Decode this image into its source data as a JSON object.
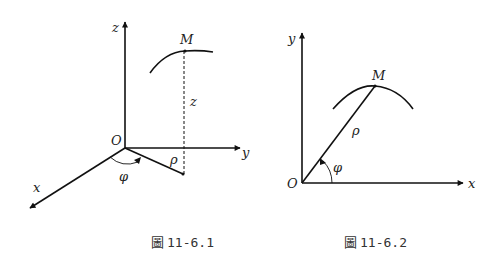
{
  "figures": [
    {
      "id": "fig-1",
      "caption_mark": "圖",
      "caption_number": "11-6.1",
      "labels": {
        "origin": "O",
        "x_axis": "x",
        "y_axis": "y",
        "z_axis": "z",
        "point": "M",
        "height": "z",
        "radius": "ρ",
        "angle": "φ"
      },
      "description": "Cylindrical coordinates in 3D: point M on a curve, dashed vertical segment of length z to the xy-plane, radial segment ρ from O at angle φ from the x-axis"
    },
    {
      "id": "fig-2",
      "caption_mark": "圖",
      "caption_number": "11-6.2",
      "labels": {
        "origin": "O",
        "x_axis": "x",
        "y_axis": "y",
        "point": "M",
        "radius": "ρ",
        "angle": "φ"
      },
      "description": "Polar coordinates in 2D: point M on a curve, segment ρ from O at angle φ from the x-axis"
    }
  ],
  "colors": {
    "stroke": "#111111",
    "text": "#222222"
  }
}
